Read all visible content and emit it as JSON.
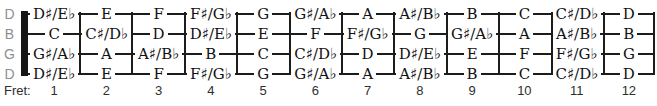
{
  "colors": {
    "background": "#ffffff",
    "line": "#1c1c1c",
    "nut": "#161616",
    "note_text": "#111111",
    "string_label_text": "#8f8f8f",
    "fret_label_text": "#2e2e2e"
  },
  "fret_caption": "Fret:",
  "fret_numbers": [
    "1",
    "2",
    "3",
    "4",
    "5",
    "6",
    "7",
    "8",
    "9",
    "10",
    "11",
    "12"
  ],
  "strings": [
    {
      "label": "D",
      "notes": [
        "D♯/E♭",
        "E",
        "F",
        "F♯/G♭",
        "G",
        "G♯/A♭",
        "A",
        "A♯/B♭",
        "B",
        "C",
        "C♯/D♭",
        "D"
      ]
    },
    {
      "label": "B",
      "notes": [
        "C",
        "C♯/D♭",
        "D",
        "D♯/E♭",
        "E",
        "F",
        "F♯/G♭",
        "G",
        "G♯/A♭",
        "A",
        "A♯/B♭",
        "B"
      ]
    },
    {
      "label": "G",
      "notes": [
        "G♯/A♭",
        "A",
        "A♯/B♭",
        "B",
        "C",
        "C♯/D♭",
        "D",
        "D♯/E♭",
        "E",
        "F",
        "F♯/G♭",
        "G"
      ]
    },
    {
      "label": "D",
      "notes": [
        "D♯/E♭",
        "E",
        "F",
        "F♯/G♭",
        "G",
        "G♯/A♭",
        "A",
        "A♯/B♭",
        "B",
        "C",
        "C♯/D♭",
        "D"
      ]
    }
  ]
}
